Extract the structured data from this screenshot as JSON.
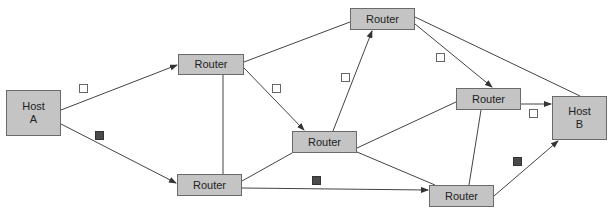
{
  "diagram": {
    "colors": {
      "node_fill": "#c4c4c4",
      "node_border": "#6a6a6a",
      "line": "#444444",
      "packet_white": "#ffffff",
      "packet_dark": "#4a4a4a"
    },
    "nodes": [
      {
        "id": "hostA",
        "type": "host",
        "label": "Host\nA"
      },
      {
        "id": "r1",
        "type": "router",
        "label": "Router"
      },
      {
        "id": "r2",
        "type": "router",
        "label": "Router"
      },
      {
        "id": "r3",
        "type": "router",
        "label": "Router"
      },
      {
        "id": "r4",
        "type": "router",
        "label": "Router"
      },
      {
        "id": "r5",
        "type": "router",
        "label": "Router"
      },
      {
        "id": "r6",
        "type": "router",
        "label": "Router"
      },
      {
        "id": "hostB",
        "type": "host",
        "label": "Host\nB"
      }
    ],
    "edges": [
      {
        "from": "hostA",
        "to": "r1",
        "directed": true
      },
      {
        "from": "hostA",
        "to": "r2",
        "directed": true
      },
      {
        "from": "r1",
        "to": "r2",
        "directed": false
      },
      {
        "from": "r1",
        "to": "r3",
        "directed": true
      },
      {
        "from": "r1",
        "to": "r4",
        "directed": false
      },
      {
        "from": "r2",
        "to": "r3",
        "directed": false
      },
      {
        "from": "r2",
        "to": "r6",
        "directed": true
      },
      {
        "from": "r3",
        "to": "r4",
        "directed": true
      },
      {
        "from": "r3",
        "to": "r5",
        "directed": false
      },
      {
        "from": "r3",
        "to": "r6",
        "directed": false
      },
      {
        "from": "r4",
        "to": "r5",
        "directed": true
      },
      {
        "from": "r4",
        "to": "hostB",
        "directed": false
      },
      {
        "from": "r5",
        "to": "hostB",
        "directed": true
      },
      {
        "from": "r5",
        "to": "r6",
        "directed": false
      },
      {
        "from": "r6",
        "to": "hostB",
        "directed": true
      }
    ],
    "packets": [
      {
        "color": "white",
        "route": "hostA-r1-r3-r4-r5-hostB"
      },
      {
        "color": "dark",
        "route": "hostA-r2-r6-hostB"
      }
    ]
  }
}
